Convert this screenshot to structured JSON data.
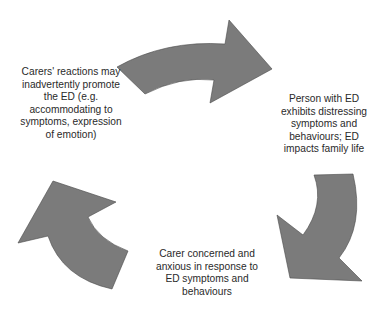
{
  "diagram": {
    "type": "cycle",
    "colors": {
      "arrow_fill": "#7b7b7b",
      "arrow_stroke": "#4a4a4a",
      "text": "#2a2a2a",
      "background": "#ffffff"
    },
    "nodes": [
      {
        "id": "person",
        "position": "right",
        "text": "Person with ED\nexhibits distressing\nsymptoms and\nbehaviours; ED\nimpacts family life"
      },
      {
        "id": "carer-concern",
        "position": "bottom",
        "text": "Carer concerned and\nanxious in response to\nED symptoms and\nbehaviours"
      },
      {
        "id": "carer-reactions",
        "position": "left",
        "text": "Carers' reactions may\ninadvertently promote\nthe ED (e.g.\naccommodating to\nsymptoms, expression\nof emotion)"
      }
    ],
    "arrows": [
      {
        "id": "top-arrow",
        "from": "carer-reactions",
        "to": "person",
        "direction": "clockwise"
      },
      {
        "id": "right-arrow",
        "from": "person",
        "to": "carer-concern",
        "direction": "clockwise"
      },
      {
        "id": "left-arrow",
        "from": "carer-concern",
        "to": "carer-reactions",
        "direction": "clockwise"
      }
    ]
  }
}
